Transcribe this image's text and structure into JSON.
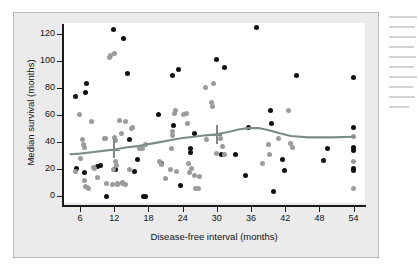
{
  "figure": {
    "panel_bg": "#ebebeb",
    "plot_bg": "#ffffff",
    "axis_color": "#1a1a1a"
  },
  "chart_data": {
    "type": "scatter",
    "title": "",
    "xlabel": "Disease-free interval (months)",
    "ylabel": "Median survival (months)",
    "xlim": [
      3,
      56
    ],
    "ylim": [
      -5,
      128
    ],
    "xticks": [
      6,
      12,
      18,
      24,
      30,
      36,
      42,
      48,
      54
    ],
    "yticks": [
      0,
      20,
      40,
      60,
      80,
      100,
      120
    ],
    "grid": false,
    "legend": null,
    "series": [
      {
        "name": "black-markers",
        "color": "#101010",
        "points": [
          [
            5.3,
            20.5
          ],
          [
            5.2,
            73.5
          ],
          [
            6.8,
            17.5
          ],
          [
            7.0,
            77.0
          ],
          [
            7.2,
            83.0
          ],
          [
            9.0,
            22.0
          ],
          [
            9.6,
            23.0
          ],
          [
            10.6,
            0.0
          ],
          [
            11.8,
            123.0
          ],
          [
            12.0,
            19.5
          ],
          [
            12.2,
            20.0
          ],
          [
            13.6,
            116.5
          ],
          [
            14.3,
            90.5
          ],
          [
            14.6,
            42.0
          ],
          [
            15.5,
            18.0
          ],
          [
            16.0,
            27.5
          ],
          [
            17.2,
            0.0
          ],
          [
            17.4,
            -0.5
          ],
          [
            19.8,
            60.5
          ],
          [
            20.2,
            24.0
          ],
          [
            22.3,
            89.0
          ],
          [
            22.4,
            52.5
          ],
          [
            23.3,
            94.0
          ],
          [
            23.6,
            8.0
          ],
          [
            25.3,
            35.5
          ],
          [
            25.4,
            32.0
          ],
          [
            26.0,
            46.0
          ],
          [
            29.9,
            101.0
          ],
          [
            30.9,
            31.0
          ],
          [
            31.4,
            95.0
          ],
          [
            33.2,
            30.5
          ],
          [
            35.0,
            15.0
          ],
          [
            35.5,
            50.5
          ],
          [
            36.9,
            125.0
          ],
          [
            39.4,
            63.5
          ],
          [
            39.6,
            54.0
          ],
          [
            40.0,
            3.5
          ],
          [
            41.5,
            27.0
          ],
          [
            41.8,
            19.0
          ],
          [
            44.0,
            89.5
          ],
          [
            48.8,
            26.5
          ],
          [
            49.5,
            35.5
          ],
          [
            54.0,
            87.5
          ],
          [
            54.0,
            50.5
          ],
          [
            54.0,
            36.0
          ],
          [
            54.0,
            34.0
          ],
          [
            54.0,
            20.5
          ],
          [
            54.0,
            19.0
          ]
        ]
      },
      {
        "name": "gray-markers",
        "color": "#9b9b9b",
        "points": [
          [
            5.2,
            18.5
          ],
          [
            5.9,
            60.5
          ],
          [
            6.0,
            28.0
          ],
          [
            6.5,
            42.0
          ],
          [
            6.6,
            38.5
          ],
          [
            6.7,
            36.0
          ],
          [
            6.8,
            11.5
          ],
          [
            7.0,
            7.5
          ],
          [
            7.3,
            6.5
          ],
          [
            7.4,
            6.0
          ],
          [
            8.0,
            55.5
          ],
          [
            8.4,
            21.5
          ],
          [
            8.6,
            20.5
          ],
          [
            9.0,
            14.0
          ],
          [
            10.3,
            43.0
          ],
          [
            10.5,
            42.5
          ],
          [
            10.6,
            9.5
          ],
          [
            11.2,
            102.5
          ],
          [
            11.4,
            104.0
          ],
          [
            11.6,
            8.5
          ],
          [
            11.9,
            20.0
          ],
          [
            12.0,
            105.5
          ],
          [
            12.1,
            43.5
          ],
          [
            12.2,
            41.0
          ],
          [
            12.3,
            25.5
          ],
          [
            12.4,
            23.0
          ],
          [
            12.5,
            9.5
          ],
          [
            12.6,
            8.5
          ],
          [
            13.0,
            56.0
          ],
          [
            13.2,
            46.5
          ],
          [
            13.4,
            10.0
          ],
          [
            13.5,
            9.5
          ],
          [
            13.9,
            55.5
          ],
          [
            14.0,
            9.0
          ],
          [
            14.6,
            20.0
          ],
          [
            15.0,
            50.0
          ],
          [
            15.2,
            51.0
          ],
          [
            16.5,
            35.5
          ],
          [
            17.0,
            35.0
          ],
          [
            17.4,
            38.0
          ],
          [
            20.0,
            25.5
          ],
          [
            20.3,
            23.5
          ],
          [
            21.0,
            13.0
          ],
          [
            21.8,
            20.0
          ],
          [
            22.0,
            35.5
          ],
          [
            22.2,
            48.0
          ],
          [
            22.3,
            45.0
          ],
          [
            22.6,
            61.0
          ],
          [
            22.8,
            63.5
          ],
          [
            23.0,
            18.0
          ],
          [
            24.2,
            60.5
          ],
          [
            24.6,
            61.5
          ],
          [
            24.8,
            53.5
          ],
          [
            25.0,
            24.0
          ],
          [
            25.2,
            17.5
          ],
          [
            25.5,
            20.5
          ],
          [
            26.0,
            15.5
          ],
          [
            26.3,
            5.5
          ],
          [
            26.8,
            6.0
          ],
          [
            27.0,
            14.5
          ],
          [
            28.0,
            80.5
          ],
          [
            28.2,
            42.0
          ],
          [
            29.0,
            69.5
          ],
          [
            29.2,
            66.5
          ],
          [
            29.4,
            83.0
          ],
          [
            30.0,
            31.5
          ],
          [
            30.6,
            42.5
          ],
          [
            31.0,
            36.5
          ],
          [
            31.3,
            30.5
          ],
          [
            38.0,
            24.5
          ],
          [
            39.0,
            38.0
          ],
          [
            39.2,
            31.0
          ],
          [
            40.8,
            43.0
          ],
          [
            42.5,
            63.5
          ],
          [
            43.0,
            39.0
          ],
          [
            43.2,
            36.0
          ],
          [
            54.0,
            44.5
          ],
          [
            54.0,
            25.5
          ],
          [
            54.0,
            6.0
          ]
        ]
      }
    ],
    "trend_line": {
      "name": "smoothed-trend",
      "color": "#7d8b8b",
      "points": [
        [
          4.3,
          31.0
        ],
        [
          6.0,
          31.5
        ],
        [
          8.0,
          32.5
        ],
        [
          10.0,
          33.5
        ],
        [
          12.0,
          34.5
        ],
        [
          14.0,
          36.0
        ],
        [
          16.0,
          37.0
        ],
        [
          18.0,
          38.5
        ],
        [
          20.0,
          40.0
        ],
        [
          22.0,
          41.5
        ],
        [
          24.0,
          43.0
        ],
        [
          26.0,
          44.0
        ],
        [
          28.0,
          45.0
        ],
        [
          30.0,
          45.8
        ],
        [
          32.0,
          47.5
        ],
        [
          34.0,
          49.5
        ],
        [
          35.5,
          50.3
        ],
        [
          37.5,
          50.3
        ],
        [
          39.0,
          49.0
        ],
        [
          41.0,
          46.5
        ],
        [
          43.0,
          44.5
        ],
        [
          46.0,
          43.5
        ],
        [
          50.0,
          43.5
        ],
        [
          54.0,
          44.0
        ]
      ]
    },
    "error_bars": [
      {
        "x": 12.0,
        "y": 34.5,
        "low": 28.0,
        "high": 43.0
      },
      {
        "x": 30.0,
        "y": 45.8,
        "low": 38.5,
        "high": 53.0
      }
    ]
  }
}
